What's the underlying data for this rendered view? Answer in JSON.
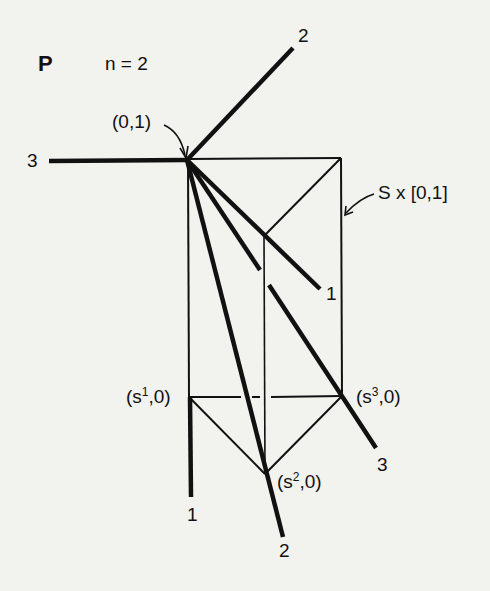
{
  "figure": {
    "panel_label": "P",
    "parameter": "n = 2",
    "apex_label": "(0,1)",
    "prism_label": "S x [0,1]",
    "vertices": [
      {
        "name": "s1",
        "base": "s",
        "sup": "1",
        "label_rest": ",0)"
      },
      {
        "name": "s2",
        "base": "s",
        "sup": "2",
        "label_rest": ",0)"
      },
      {
        "name": "s3",
        "base": "s",
        "sup": "3",
        "label_rest": ",0)"
      }
    ],
    "ray_labels": {
      "ray_top_2": "2",
      "ray_left_3": "3",
      "ray_1": "1",
      "ray_3": "3",
      "ray_bottom_1": "1",
      "ray_bottom_2": "2"
    },
    "open_paren": "("
  },
  "colors": {
    "background": "#f2f2ef",
    "ink": "#111111"
  }
}
